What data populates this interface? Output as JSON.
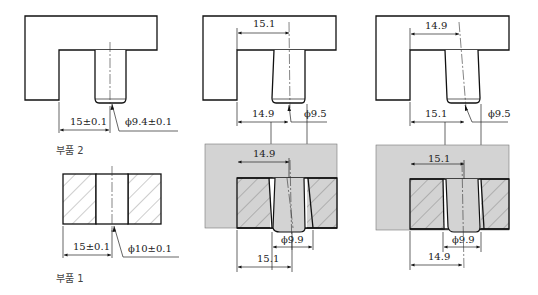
{
  "figure": {
    "part_labels": {
      "part2": "부품 2",
      "part1": "부품 1"
    },
    "columns": [
      {
        "id": "nominal",
        "part2": {
          "position_dim": "15±0.1",
          "diameter_dim": "ϕ9.4±0.1"
        },
        "part1": {
          "position_dim": "15±0.1",
          "diameter_dim": "ϕ10±0.1"
        }
      },
      {
        "id": "case-a",
        "part2": {
          "top_dim": "15.1",
          "bottom_dim": "14.9",
          "diameter_dim": "ϕ9.5"
        },
        "part1": {
          "top_dim": "14.9",
          "diameter_dim": "ϕ9.9",
          "bottom_dim": "15.1"
        }
      },
      {
        "id": "case-b",
        "part2": {
          "top_dim": "14.9",
          "bottom_dim": "15.1",
          "diameter_dim": "ϕ9.5"
        },
        "part1": {
          "top_dim": "15.1",
          "diameter_dim": "ϕ9.9",
          "bottom_dim": "14.9"
        }
      }
    ],
    "colors": {
      "line": "#111111",
      "assembly_background": "#d3d3d3",
      "hatch": "#555555"
    }
  }
}
